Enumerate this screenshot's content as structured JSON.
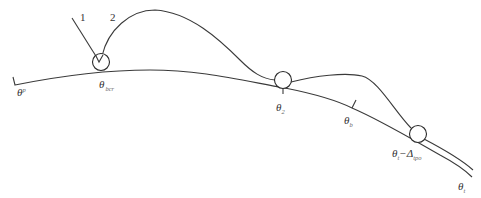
{
  "diagram": {
    "trajectory_labels": {
      "line_1": "1",
      "line_2": "2"
    },
    "points": [
      {
        "id": "start",
        "symbol": "θ",
        "sup": "p",
        "label": "θᵖ"
      },
      {
        "id": "takeoff",
        "symbol": "θ",
        "sub": "bcr",
        "label": "θ_bcr"
      },
      {
        "id": "landing_2",
        "symbol": "θ",
        "sub": "2",
        "label": "θ₂"
      },
      {
        "id": "b_mark",
        "symbol": "θ",
        "sub": "b",
        "label": "θ_b"
      },
      {
        "id": "t_minus_delta",
        "symbol": "θ",
        "sub": "t",
        "minus": "−",
        "delta": "Δ",
        "delta_sub": "tpo",
        "label": "θ_t − Δ_tpo"
      },
      {
        "id": "end",
        "symbol": "θ",
        "sub": "t",
        "label": "θ_t"
      }
    ],
    "colors": {
      "stroke": "#3a3a3a",
      "text": "#333333",
      "background": "#ffffff"
    }
  }
}
